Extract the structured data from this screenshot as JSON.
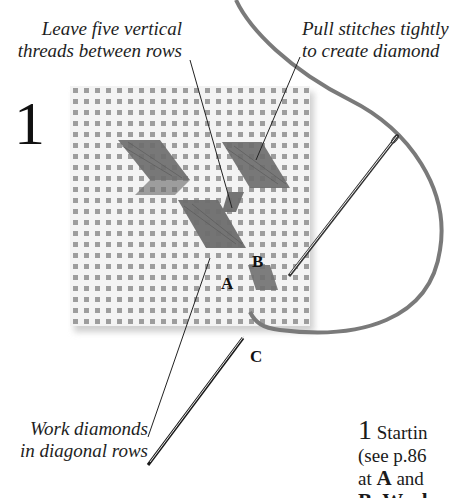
{
  "step": {
    "number": "1"
  },
  "annotations": {
    "top_left": [
      "Leave five vertical",
      "threads between rows"
    ],
    "top_right": [
      "Pull stitches tightly",
      "to create diamond"
    ],
    "bottom_left": [
      "Work diamonds",
      "in diagonal rows"
    ]
  },
  "points": {
    "a": "A",
    "b": "B",
    "c": "C"
  },
  "instructions": {
    "number": "1",
    "line1": "Startin",
    "line2": "(see p.86",
    "line3_pre": "at ",
    "line3_bold": "A",
    "line3_post": " and",
    "line4": "B. Work"
  },
  "colors": {
    "fabric": "#f1f1f1",
    "fabric_hole": "#9a9a9a",
    "thread": "#6e6e6e",
    "needle": "#2a2a2a",
    "text": "#1e1e1e"
  }
}
